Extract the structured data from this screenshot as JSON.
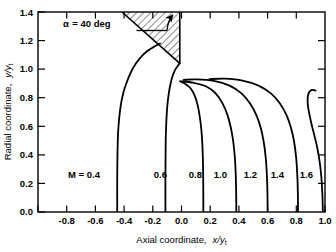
{
  "chart_data": {
    "type": "line",
    "title": "",
    "xlabel": "Axial coordinate,  x/yt",
    "ylabel": "Radial coordinate,  y/yt",
    "xlabel_text": "Axial coordinate,",
    "xlabel_var": "x/y",
    "xlabel_sub": "t",
    "ylabel_text": "Radial coordinate,",
    "ylabel_var": "y/y",
    "ylabel_sub": "t",
    "xlim": [
      -1.0,
      1.0
    ],
    "ylim": [
      0.0,
      1.4
    ],
    "x_ticks": [
      -1.0,
      -0.8,
      -0.6,
      -0.4,
      -0.2,
      0.0,
      0.2,
      0.4,
      0.6,
      0.8,
      1.0
    ],
    "x_tick_labels": [
      "",
      "-0.8",
      "-0.6",
      "-0.4",
      "-0.2",
      "0.0",
      "0.2",
      "0.4",
      "0.6",
      "0.8",
      "1.0"
    ],
    "y_ticks": [
      0.0,
      0.2,
      0.4,
      0.6,
      0.8,
      1.0,
      1.2,
      1.4
    ],
    "y_tick_labels": [
      "0.0",
      "0.2",
      "0.4",
      "0.6",
      "0.8",
      "1.0",
      "1.2",
      "1.4"
    ],
    "grid": false,
    "legend_position": "inline-curve-labels",
    "annotation": {
      "text": "= 40 deg",
      "symbol": "α",
      "equals": "=",
      "full": "α = 40 deg",
      "hatched_region": "wall wedge at 40 deg above throat"
    },
    "series": [
      {
        "name": "M = 0.4",
        "label": "M = 0.4",
        "label_prefix": "M =",
        "label_value": "0.4",
        "label_at": {
          "x": -0.63,
          "y": 0.3
        },
        "points": [
          [
            -0.448,
            0.0
          ],
          [
            -0.448,
            0.1
          ],
          [
            -0.448,
            0.22
          ],
          [
            -0.447,
            0.34
          ],
          [
            -0.445,
            0.46
          ],
          [
            -0.441,
            0.57
          ],
          [
            -0.433,
            0.67
          ],
          [
            -0.421,
            0.76
          ],
          [
            -0.404,
            0.84
          ],
          [
            -0.381,
            0.91
          ],
          [
            -0.352,
            0.98
          ],
          [
            -0.318,
            1.04
          ],
          [
            -0.278,
            1.09
          ],
          [
            -0.233,
            1.13
          ],
          [
            -0.186,
            1.16
          ],
          [
            -0.15,
            1.18
          ]
        ]
      },
      {
        "name": "M = 0.6",
        "label": "0.6",
        "label_value": "0.6",
        "label_at": {
          "x": -0.115,
          "y": 0.3
        },
        "points": [
          [
            -0.112,
            0.0
          ],
          [
            -0.112,
            0.12
          ],
          [
            -0.112,
            0.25
          ],
          [
            -0.111,
            0.38
          ],
          [
            -0.11,
            0.5
          ],
          [
            -0.107,
            0.6
          ],
          [
            -0.102,
            0.7
          ],
          [
            -0.094,
            0.79
          ],
          [
            -0.082,
            0.87
          ],
          [
            -0.066,
            0.94
          ],
          [
            -0.047,
            0.99
          ],
          [
            -0.028,
            1.02
          ],
          [
            -0.012,
            1.04
          ]
        ]
      },
      {
        "name": "M = 0.8",
        "label": "0.8",
        "label_value": "0.8",
        "label_at": {
          "x": 0.125,
          "y": 0.3
        },
        "points": [
          [
            0.152,
            0.0
          ],
          [
            0.152,
            0.12
          ],
          [
            0.151,
            0.25
          ],
          [
            0.149,
            0.37
          ],
          [
            0.145,
            0.48
          ],
          [
            0.138,
            0.58
          ],
          [
            0.127,
            0.67
          ],
          [
            0.112,
            0.75
          ],
          [
            0.09,
            0.82
          ],
          [
            0.06,
            0.87
          ],
          [
            0.022,
            0.9
          ],
          [
            -0.01,
            0.915
          ]
        ]
      },
      {
        "name": "M = 1.0",
        "label": "1.0",
        "label_value": "1.0",
        "label_at": {
          "x": 0.295,
          "y": 0.3
        },
        "points": [
          [
            0.382,
            0.0
          ],
          [
            0.381,
            0.13
          ],
          [
            0.378,
            0.26
          ],
          [
            0.372,
            0.38
          ],
          [
            0.361,
            0.49
          ],
          [
            0.344,
            0.59
          ],
          [
            0.32,
            0.68
          ],
          [
            0.286,
            0.76
          ],
          [
            0.238,
            0.83
          ],
          [
            0.17,
            0.88
          ],
          [
            0.08,
            0.905
          ],
          [
            -0.005,
            0.915
          ]
        ]
      },
      {
        "name": "M = 1.2",
        "label": "1.2",
        "label_value": "1.2",
        "label_at": {
          "x": 0.5,
          "y": 0.3
        },
        "points": [
          [
            0.6,
            0.0
          ],
          [
            0.599,
            0.13
          ],
          [
            0.595,
            0.26
          ],
          [
            0.587,
            0.38
          ],
          [
            0.573,
            0.49
          ],
          [
            0.552,
            0.59
          ],
          [
            0.521,
            0.68
          ],
          [
            0.478,
            0.76
          ],
          [
            0.418,
            0.83
          ],
          [
            0.335,
            0.885
          ],
          [
            0.225,
            0.918
          ],
          [
            0.1,
            0.928
          ],
          [
            0.015,
            0.925
          ]
        ]
      },
      {
        "name": "M = 1.4",
        "label": "1.4",
        "label_value": "1.4",
        "label_at": {
          "x": 0.685,
          "y": 0.3
        },
        "points": [
          [
            0.812,
            0.0
          ],
          [
            0.811,
            0.13
          ],
          [
            0.807,
            0.26
          ],
          [
            0.799,
            0.38
          ],
          [
            0.785,
            0.49
          ],
          [
            0.763,
            0.59
          ],
          [
            0.731,
            0.68
          ],
          [
            0.686,
            0.76
          ],
          [
            0.623,
            0.83
          ],
          [
            0.537,
            0.885
          ],
          [
            0.425,
            0.92
          ],
          [
            0.3,
            0.933
          ],
          [
            0.195,
            0.93
          ]
        ]
      },
      {
        "name": "M = 1.6",
        "label": "1.6",
        "label_value": "1.6",
        "label_at": {
          "x": 0.875,
          "y": 0.3
        },
        "points": [
          [
            0.985,
            0.0
          ],
          [
            0.982,
            0.12
          ],
          [
            0.975,
            0.24
          ],
          [
            0.963,
            0.35
          ],
          [
            0.946,
            0.45
          ],
          [
            0.925,
            0.54
          ],
          [
            0.905,
            0.62
          ],
          [
            0.89,
            0.69
          ],
          [
            0.881,
            0.745
          ],
          [
            0.879,
            0.79
          ],
          [
            0.884,
            0.825
          ],
          [
            0.897,
            0.848
          ],
          [
            0.915,
            0.855
          ],
          [
            0.934,
            0.85
          ]
        ]
      }
    ],
    "wall": {
      "name": "nozzle wall",
      "angle_deg": 40,
      "points": [
        [
          -0.415,
          1.4
        ],
        [
          -0.012,
          1.04
        ],
        [
          -0.012,
          1.04
        ]
      ],
      "throat_x": -0.012,
      "throat_y": 1.04
    }
  },
  "caption": {
    "visible": false,
    "text": ""
  }
}
